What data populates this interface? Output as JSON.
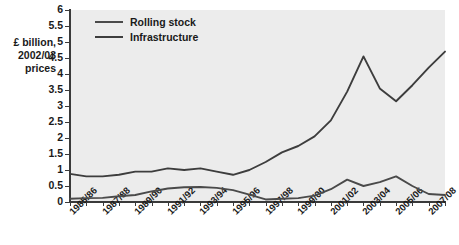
{
  "axis_title": [
    "£ billion,",
    "2002/03",
    "prices"
  ],
  "legend": {
    "position": "top-left-inside",
    "items": [
      {
        "label": "Rolling stock",
        "color": "#4a4a4a"
      },
      {
        "label": "Infrastructure",
        "color": "#3d3d3d"
      }
    ]
  },
  "chart_data": {
    "type": "line",
    "title": "",
    "xlabel": "",
    "ylabel": "£ billion, 2002/03 prices",
    "ylim": [
      0,
      6
    ],
    "ytick_values": [
      0,
      0.5,
      1,
      1.5,
      2,
      2.5,
      3,
      3.5,
      4,
      4.5,
      5,
      5.5,
      6
    ],
    "ytick_labels": [
      "0",
      "0.5",
      "1",
      "1.5",
      "2",
      "2.5",
      "3",
      "3.5",
      "4",
      "4.5",
      "5",
      "5.5",
      "6"
    ],
    "grid": false,
    "x": [
      "1985/86",
      "1986/87",
      "1987/88",
      "1988/89",
      "1989/90",
      "1990/91",
      "1991/92",
      "1992/93",
      "1993/94",
      "1994/95",
      "1995/96",
      "1996/97",
      "1997/98",
      "1998/99",
      "1999/00",
      "2000/01",
      "2001/02",
      "2002/03",
      "2003/04",
      "2004/05",
      "2005/06",
      "2006/07",
      "2007/08",
      "2008/09"
    ],
    "xtick_labels_shown": [
      "1985/86",
      "1987/88",
      "1989/90",
      "1991/92",
      "1993/94",
      "1995/96",
      "1997/98",
      "1999/00",
      "2001/02",
      "2003/04",
      "2005/06",
      "2007/08"
    ],
    "xtick_label_interval": 2,
    "series": [
      {
        "name": "Infrastructure",
        "color": "#3d3d3d",
        "values": [
          0.88,
          0.8,
          0.8,
          0.85,
          0.95,
          0.95,
          1.05,
          1.0,
          1.05,
          0.95,
          0.85,
          1.0,
          1.25,
          1.55,
          1.75,
          2.05,
          2.55,
          3.45,
          4.55,
          3.55,
          3.15,
          3.65,
          4.2,
          4.7
        ]
      },
      {
        "name": "Rolling stock",
        "color": "#4a4a4a",
        "values": [
          0.1,
          0.12,
          0.13,
          0.18,
          0.22,
          0.33,
          0.42,
          0.46,
          0.47,
          0.44,
          0.37,
          0.23,
          0.08,
          0.1,
          0.12,
          0.2,
          0.4,
          0.7,
          0.5,
          0.62,
          0.8,
          0.5,
          0.25,
          0.22
        ]
      }
    ]
  },
  "geometry": {
    "plot_left": 70,
    "plot_top": 10,
    "plot_width": 375,
    "plot_height": 192
  }
}
